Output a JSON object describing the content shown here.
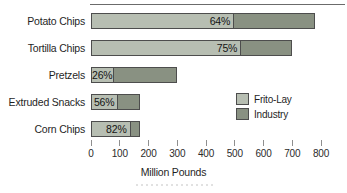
{
  "chart_data": {
    "type": "bar",
    "orientation": "horizontal",
    "stacked": true,
    "title": "",
    "xlabel": "Million Pounds",
    "xlim": [
      0,
      800
    ],
    "x_ticks": [
      0,
      100,
      200,
      300,
      400,
      500,
      600,
      700,
      800
    ],
    "grid": false,
    "categories": [
      "Potato Chips",
      "Tortilla Chips",
      "Pretzels",
      "Extruded Snacks",
      "Corn Chips"
    ],
    "totals_million_pounds": [
      780,
      700,
      300,
      170,
      170
    ],
    "frito_lay_share_pct": [
      64,
      75,
      26,
      56,
      82
    ],
    "percent_labels": [
      "64%",
      "75%",
      "26%",
      "56%",
      "82%"
    ],
    "series": [
      {
        "name": "Frito-Lay",
        "values": [
          499,
          525,
          78,
          95,
          139
        ],
        "color": "#b7beb2"
      },
      {
        "name": "Industry",
        "values": [
          281,
          175,
          222,
          75,
          31
        ],
        "color": "#899182"
      }
    ],
    "legend": [
      {
        "label": "Frito-Lay",
        "color": "#b7beb2"
      },
      {
        "label": "Industry",
        "color": "#899182"
      }
    ],
    "legend_position": "middle-right",
    "colors": {
      "bar_border": "#4d4d4d",
      "tick": "#8f8f8f",
      "text": "#1f1f1f"
    }
  }
}
